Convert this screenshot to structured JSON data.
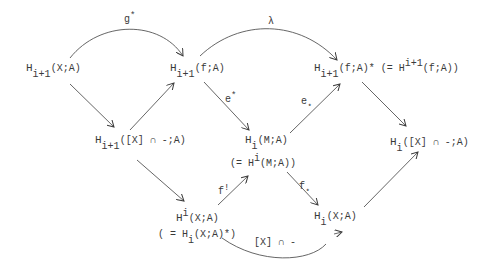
{
  "nodes": {
    "n1": {
      "H": "H",
      "sub": "i+1",
      "args": "(X;A)"
    },
    "n2": {
      "H": "H",
      "sub": "i+1",
      "args": "(f;A)"
    },
    "n3": {
      "H": "H",
      "sub": "i+1",
      "args": "(f;A)*",
      "eq_open": " (= H",
      "eq_sup": "i+1",
      "eq_args": "(f;A))"
    },
    "n4": {
      "H": "H",
      "sub": "i+1",
      "args": "([X] ∩ -;A)"
    },
    "n5": {
      "H": "H",
      "sub": "i",
      "args": "(M;A)",
      "eq_open": "(= H",
      "eq_sup": "i",
      "eq_args": "(M;A))"
    },
    "n6": {
      "H": "H",
      "sub": "i",
      "args": "([X] ∩ -;A)"
    },
    "n7": {
      "H": "H",
      "sup": "i",
      "args": "(X;A)",
      "eq_open": "( = H",
      "eq_sub": "i",
      "eq_args": "(X;A)*)"
    },
    "n8": {
      "H": "H",
      "sub": "i",
      "args": "(X;A)"
    }
  },
  "edges": {
    "g_star": {
      "label": "g",
      "sup": "*"
    },
    "lambda": {
      "label": "λ"
    },
    "e_star_upper": {
      "label": "e",
      "sup": "*"
    },
    "e_star_lower": {
      "label": "e",
      "sub": "⋆"
    },
    "f_shriek": {
      "label": "f",
      "sup": "!"
    },
    "f_star": {
      "label": "f",
      "sub": "⋆"
    },
    "cap": {
      "label": "[X] ∩ -"
    }
  },
  "colors": {
    "ink": "#3a3a3a",
    "background": "#ffffff"
  }
}
